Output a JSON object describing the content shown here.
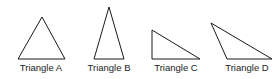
{
  "diagram": {
    "stroke_color": "#1a1a1a",
    "triangles": [
      {
        "label": "Triangle A",
        "points": "42,17 18,59 65,59",
        "label_x": 41
      },
      {
        "label": "Triangle B",
        "points": "109,7 94,59 124,59",
        "label_x": 109
      },
      {
        "label": "Triangle C",
        "points": "152,30 152,59 200,59",
        "label_x": 176
      },
      {
        "label": "Triangle D",
        "points": "211,23 227,59 272,59",
        "label_x": 247
      }
    ]
  }
}
